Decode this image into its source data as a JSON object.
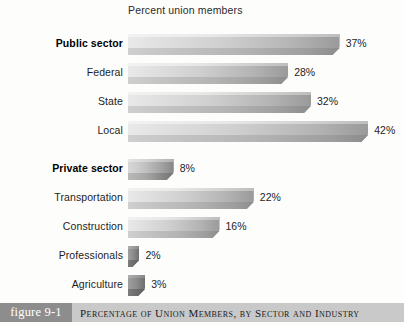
{
  "chart_data": {
    "type": "bar",
    "orientation": "horizontal",
    "title": "Percent union members",
    "xlabel": "",
    "ylabel": "",
    "xlim": [
      0,
      45
    ],
    "grid": false,
    "legend": null,
    "value_suffix": "%",
    "categories": [
      "Public sector",
      "Federal",
      "State",
      "Local",
      "Private sector",
      "Transportation",
      "Construction",
      "Professionals",
      "Agriculture"
    ],
    "values": [
      37,
      28,
      32,
      42,
      8,
      22,
      16,
      2,
      3
    ],
    "value_labels": [
      "37%",
      "28%",
      "32%",
      "42%",
      "8%",
      "22%",
      "16%",
      "2%",
      "3%"
    ],
    "emphasis": [
      true,
      false,
      false,
      false,
      true,
      false,
      false,
      false,
      false
    ],
    "group_break_after_index": 3
  },
  "caption": {
    "figure_number": "figure 9-1",
    "text": "Percentage of Union Members, by Sector and Industry"
  },
  "colors": {
    "bar_light": "#e9e9e9",
    "bar_dark": "#8c8c8c",
    "figure_tag_bg": "#8d8d8d",
    "caption_bg": "#c9c9c9",
    "text": "#1d1d1d",
    "background": "#fdfdfc"
  }
}
